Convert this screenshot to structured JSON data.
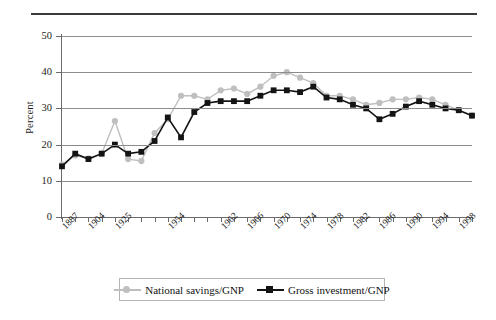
{
  "chart_data": {
    "type": "line",
    "title": "",
    "xlabel": "",
    "ylabel": "Percent",
    "ylim": [
      0,
      50
    ],
    "yticks": [
      0,
      10,
      20,
      30,
      40,
      50
    ],
    "grid": true,
    "legend_position": "bottom",
    "xtick_labels": [
      "1887",
      "1904",
      "1925",
      "1954",
      "1962",
      "1966",
      "1970",
      "1974",
      "1978",
      "1982",
      "1986",
      "1990",
      "1994",
      "1998"
    ],
    "xtick_indices": [
      0,
      2,
      4,
      8,
      12,
      14,
      16,
      18,
      20,
      22,
      24,
      26,
      28,
      30
    ],
    "x": [
      "1887",
      "1897",
      "1904",
      "1919",
      "1925",
      "1935",
      "1940",
      "1952",
      "1954",
      "1956",
      "1958",
      "1960",
      "1962",
      "1964",
      "1966",
      "1968",
      "1970",
      "1972",
      "1974",
      "1976",
      "1978",
      "1980",
      "1982",
      "1984",
      "1986",
      "1988",
      "1990",
      "1992",
      "1994",
      "1996",
      "1998",
      "2000"
    ],
    "series": [
      {
        "name": "National savings/GNP",
        "color": "#bfbfbf",
        "marker": "circle",
        "values": [
          14.5,
          17.0,
          16.2,
          17.5,
          26.5,
          16.0,
          15.5,
          23.2,
          27.0,
          33.5,
          33.5,
          32.5,
          35.0,
          35.5,
          34.0,
          36.0,
          39.0,
          40.0,
          38.5,
          37.0,
          33.5,
          33.5,
          32.5,
          31.0,
          31.5,
          32.5,
          32.5,
          33.0,
          32.5,
          31.0,
          29.5,
          28.0
        ]
      },
      {
        "name": "Gross investment/GNP",
        "color": "#141414",
        "marker": "square",
        "values": [
          14.0,
          17.5,
          16.0,
          17.5,
          20.0,
          17.5,
          18.0,
          21.0,
          27.5,
          22.0,
          29.0,
          31.5,
          32.0,
          32.0,
          32.0,
          33.5,
          35.0,
          35.0,
          34.5,
          36.0,
          33.0,
          32.5,
          31.0,
          30.0,
          27.0,
          28.5,
          30.5,
          32.0,
          31.0,
          30.0,
          29.5,
          28.0
        ]
      }
    ]
  },
  "legend": {
    "items": [
      {
        "label": "National savings/GNP",
        "marker": "circle",
        "color": "#bfbfbf"
      },
      {
        "label": "Gross investment/GNP",
        "marker": "square",
        "color": "#141414"
      }
    ]
  },
  "axis": {
    "y_title": "Percent"
  }
}
